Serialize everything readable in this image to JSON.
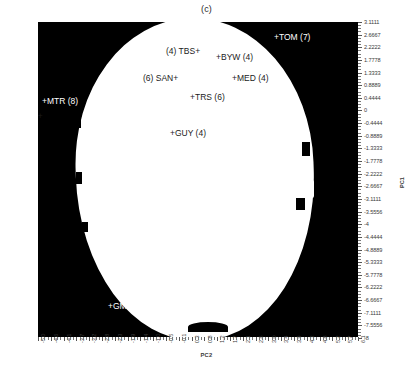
{
  "figure": {
    "title": "(c)"
  },
  "axes": {
    "x": {
      "label": "PC2",
      "ticks": [
        "-5.0",
        "-4.6",
        "-4.1",
        "-3.7",
        "-3.2",
        "-2.8",
        "-2.3",
        "-1.9",
        "-1.4",
        "-1.0",
        "-0.5",
        "-0.1",
        "0.3",
        "0.8",
        "1.2",
        "1.7",
        "2.1",
        "2.6",
        "3.0",
        "3.4",
        "3.9",
        "4.3",
        "4.8",
        "5.2",
        "5.7",
        "6.1"
      ],
      "min": -5.0,
      "max": 6.1
    },
    "y": {
      "label": "PC1",
      "ticks": [
        "3.1111",
        "2.6667",
        "2.2222",
        "1.7778",
        "1.3333",
        "0.8889",
        "0.4444",
        "0",
        "-0.4444",
        "-0.8889",
        "-1.3333",
        "-1.7778",
        "-2.2222",
        "-2.6667",
        "-3.1111",
        "-3.5556",
        "-4",
        "-4.4444",
        "-4.8889",
        "-5.3333",
        "-5.7778",
        "-6.2222",
        "-6.6667",
        "-7.1111",
        "-7.5556",
        "-8"
      ],
      "min": -8,
      "max": 3.1111
    }
  },
  "colors": {
    "region_fill": "#ffffff",
    "background": "#000000",
    "label_on_white": "#1b1b1b",
    "label_on_black": "#ffffff",
    "axis": "#3a3a3a"
  },
  "chart_data": {
    "type": "scatter",
    "title": "(c)",
    "xlabel": "PC2",
    "ylabel": "PC1",
    "xlim": [
      -5.0,
      6.1
    ],
    "ylim": [
      -8,
      3.1111
    ],
    "grid": false,
    "legend": "none",
    "region": {
      "description": "white elliptical membership region over black background",
      "fill": "#ffffff",
      "background": "#000000"
    },
    "points": [
      {
        "name": "TBS",
        "label": "(4) TBS+",
        "count": 4,
        "x": -0.3,
        "y": 2.15,
        "marker": "+",
        "text_side": "left",
        "on_region": true
      },
      {
        "name": "BYW",
        "label": "+BYW (4)",
        "count": 4,
        "x": 1.25,
        "y": 2.0,
        "marker": "+",
        "text_side": "right",
        "on_region": true
      },
      {
        "name": "TOM",
        "label": "+TOM (7)",
        "count": 7,
        "x": 3.4,
        "y": 2.75,
        "marker": "+",
        "text_side": "right",
        "on_region": false
      },
      {
        "name": "SAN",
        "label": "(6) SAN+",
        "count": 6,
        "x": -0.75,
        "y": 1.3,
        "marker": "+",
        "text_side": "left",
        "on_region": true
      },
      {
        "name": "MED",
        "label": "+MED (4)",
        "count": 4,
        "x": 1.6,
        "y": 1.3,
        "marker": "+",
        "text_side": "right",
        "on_region": true
      },
      {
        "name": "TRS",
        "label": "+TRS (6)",
        "count": 6,
        "x": 0.35,
        "y": 0.7,
        "marker": "+",
        "text_side": "right",
        "on_region": true
      },
      {
        "name": "MTR",
        "label": "+MTR (8)",
        "count": 8,
        "x": -4.85,
        "y": 0.15,
        "marker": "+",
        "text_side": "right",
        "on_region": false
      },
      {
        "name": "MST",
        "label": "(6) MST+",
        "count": 6,
        "x": -5.0,
        "y": -0.2,
        "marker": "+",
        "text_side": "left",
        "on_region": false
      },
      {
        "name": "GUY",
        "label": "+GUY (4)",
        "count": 4,
        "x": -0.35,
        "y": -0.65,
        "marker": "+",
        "text_side": "right",
        "on_region": true
      },
      {
        "name": "GMG",
        "label": "+GMG (8)",
        "count": 8,
        "x": -2.35,
        "y": -6.65,
        "marker": "+",
        "text_side": "right",
        "on_region": false
      }
    ]
  }
}
